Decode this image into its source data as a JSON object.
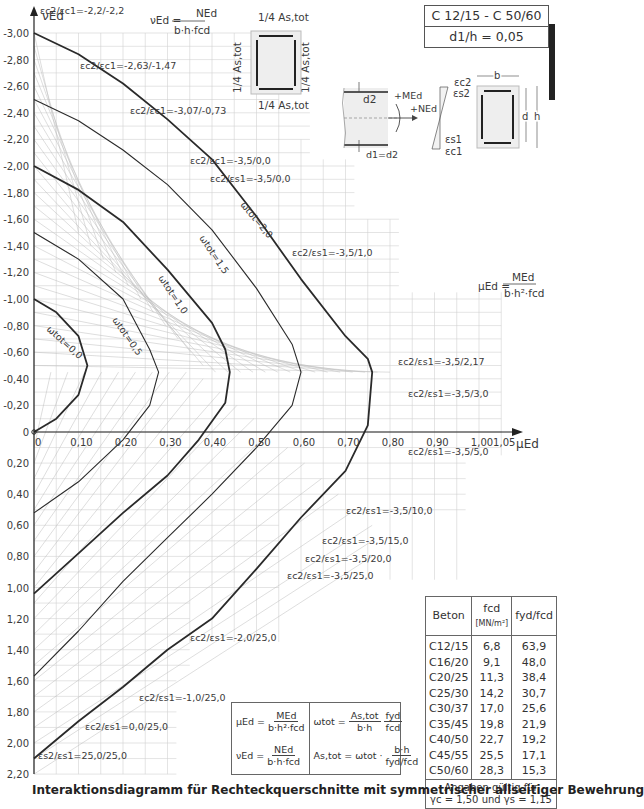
{
  "header": {
    "range_label": "C 12/15 - C 50/60",
    "ratio_label": "d1/h = 0,05",
    "nu_formula": {
      "lhs": "νEd =",
      "num": "NEd",
      "den": "b·h·fcd"
    },
    "mu_formula": {
      "lhs": "μEd =",
      "num": "MEd",
      "den": "b·h²·fcd"
    },
    "reinforcement_quarter": "1/4 As,tot",
    "section_labels": {
      "d2": "d2",
      "d1d2": "d1=d2",
      "MEd": "+MEd",
      "NEd": "+NEd",
      "ec2": "εc2",
      "es2": "εs2",
      "es1": "εs1",
      "ec1": "εc1",
      "b": "b",
      "d": "d",
      "h": "h"
    }
  },
  "chart_data": {
    "type": "line",
    "title": "Interaktionsdiagramm für Rechteckquerschnitte mit symmetrischer allseitiger Bewehrung",
    "xlabel": "μEd",
    "ylabel": "νEd",
    "xlim": [
      0,
      1.05
    ],
    "ylim": [
      -3.0,
      2.2
    ],
    "y_inverted": true,
    "grid": true,
    "x_ticks": [
      "0",
      "0,10",
      "0,20",
      "0,30",
      "0,40",
      "0,50",
      "0,60",
      "0,70",
      "0,80",
      "0,90",
      "1,00",
      "1,05"
    ],
    "y_ticks": [
      "-3,00",
      "-2,80",
      "-2,60",
      "-2,40",
      "-2,20",
      "-2,00",
      "-1,80",
      "-1,60",
      "-1,40",
      "-1,20",
      "-1,00",
      "-0,80",
      "-0,60",
      "-0,40",
      "-0,20",
      "0",
      "0,20",
      "0,40",
      "0,60",
      "0,80",
      "1,00",
      "1,20",
      "1,40",
      "1,60",
      "1,80",
      "2,00",
      "2,20"
    ],
    "series": [
      {
        "name": "ωtot = 0,0",
        "bold": true,
        "points": [
          [
            0,
            -1.0
          ],
          [
            0.05,
            -0.9
          ],
          [
            0.1,
            -0.72
          ],
          [
            0.12,
            -0.5
          ],
          [
            0.1,
            -0.28
          ],
          [
            0.05,
            -0.1
          ],
          [
            0,
            0
          ]
        ]
      },
      {
        "name": "ωtot = 0,5",
        "bold": false,
        "points": [
          [
            0,
            -1.5
          ],
          [
            0.1,
            -1.3
          ],
          [
            0.2,
            -1.0
          ],
          [
            0.26,
            -0.62
          ],
          [
            0.28,
            -0.45
          ],
          [
            0.26,
            -0.2
          ],
          [
            0.2,
            0.05
          ],
          [
            0.1,
            0.32
          ],
          [
            0,
            0.52
          ]
        ]
      },
      {
        "name": "ωtot = 1,0",
        "bold": true,
        "points": [
          [
            0,
            -2.0
          ],
          [
            0.1,
            -1.82
          ],
          [
            0.2,
            -1.58
          ],
          [
            0.3,
            -1.22
          ],
          [
            0.4,
            -0.82
          ],
          [
            0.43,
            -0.62
          ],
          [
            0.44,
            -0.45
          ],
          [
            0.43,
            -0.22
          ],
          [
            0.37,
            0.05
          ],
          [
            0.3,
            0.28
          ],
          [
            0.2,
            0.52
          ],
          [
            0.1,
            0.78
          ],
          [
            0,
            1.04
          ]
        ]
      },
      {
        "name": "ωtot = 1,5",
        "bold": false,
        "points": [
          [
            0,
            -2.5
          ],
          [
            0.1,
            -2.34
          ],
          [
            0.2,
            -2.12
          ],
          [
            0.3,
            -1.86
          ],
          [
            0.4,
            -1.52
          ],
          [
            0.5,
            -1.08
          ],
          [
            0.58,
            -0.66
          ],
          [
            0.6,
            -0.45
          ],
          [
            0.58,
            -0.2
          ],
          [
            0.5,
            0.1
          ],
          [
            0.4,
            0.4
          ],
          [
            0.3,
            0.68
          ],
          [
            0.2,
            0.96
          ],
          [
            0.1,
            1.28
          ],
          [
            0,
            1.57
          ]
        ]
      },
      {
        "name": "ωtot = 2,0",
        "bold": true,
        "points": [
          [
            0,
            -3.0
          ],
          [
            0.1,
            -2.84
          ],
          [
            0.2,
            -2.62
          ],
          [
            0.3,
            -2.35
          ],
          [
            0.4,
            -2.05
          ],
          [
            0.5,
            -1.62
          ],
          [
            0.6,
            -1.15
          ],
          [
            0.7,
            -0.72
          ],
          [
            0.75,
            -0.55
          ],
          [
            0.76,
            -0.45
          ],
          [
            0.75,
            -0.05
          ],
          [
            0.7,
            0.25
          ],
          [
            0.6,
            0.55
          ],
          [
            0.5,
            0.88
          ],
          [
            0.4,
            1.2
          ],
          [
            0.3,
            1.4
          ],
          [
            0.2,
            1.64
          ],
          [
            0.1,
            1.86
          ],
          [
            0,
            2.1
          ]
        ]
      }
    ],
    "strain_annotations": [
      "εc2/εc1 = -2,2/-2,2",
      "εc2/εc1 = -2,63/-1,47",
      "εc2/εc1 = -3,07/-0,73",
      "εc2/εc1 = -3,5/0,0",
      "εc2/εs1 = -3,5/0,0",
      "εc2/εs1 = -3,5/1,0",
      "εc2/εs1 = -3,5/2,17",
      "εc2/εs1 = -3,5/3,0",
      "εc2/εs1 = -3,5/5,0",
      "εc2/εs1 = -3,5/10,0",
      "εc2/εs1 = -3,5/15,0",
      "εc2/εs1 = -3,5/20,0",
      "εc2/εs1 = -3,5/25,0",
      "εc2/εs1 = -2,0/25,0",
      "εc2/εs1 = -1,0/25,0",
      "εc2/εs1 = 0,0/25,0",
      "εs2/εs1 = 25,0/25,0"
    ]
  },
  "table": {
    "headers": [
      "Beton",
      "fcd",
      "[MN/m²]",
      "fyd/fcd"
    ],
    "rows": [
      [
        "C12/15",
        "6,8",
        "63,9"
      ],
      [
        "C16/20",
        "9,1",
        "48,0"
      ],
      [
        "C20/25",
        "11,3",
        "38,4"
      ],
      [
        "C25/30",
        "14,2",
        "30,7"
      ],
      [
        "C30/37",
        "17,0",
        "25,6"
      ],
      [
        "C35/45",
        "19,8",
        "21,9"
      ],
      [
        "C40/50",
        "22,7",
        "19,2"
      ],
      [
        "C45/55",
        "25,5",
        "17,1"
      ],
      [
        "C50/60",
        "28,3",
        "15,3"
      ]
    ],
    "note_line1": "Angaben gültig für",
    "note_line2": "γc = 1,50 und γs = 1,15"
  },
  "formulas": {
    "mu": {
      "lhs": "μEd =",
      "num": "MEd",
      "den": "b·h²·fcd"
    },
    "nu": {
      "lhs": "νEd =",
      "num": "NEd",
      "den": "b·h·fcd"
    },
    "omega": {
      "lhs": "ωtot =",
      "num1": "As,tot",
      "den1": "b·h",
      "num2": "fyd",
      "den2": "fcd"
    },
    "As": {
      "lhs": "As,tot = ωtot ·",
      "num": "b·h",
      "den": "fyd/fcd"
    }
  },
  "caption": "Interaktionsdiagramm für Rechteckquerschnitte mit symmetrischer allseitiger Bewehrung"
}
